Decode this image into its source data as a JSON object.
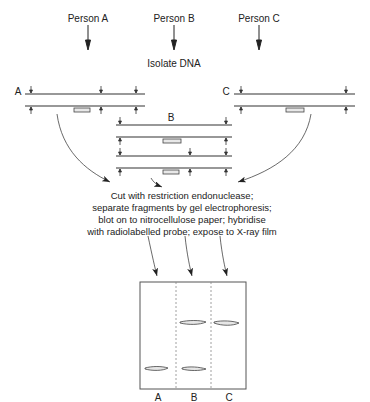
{
  "persons": [
    {
      "label": "Person A",
      "x": 88
    },
    {
      "label": "Person B",
      "x": 174
    },
    {
      "label": "Person C",
      "x": 259
    }
  ],
  "step1": "Isolate DNA",
  "dna_labels": {
    "a": "A",
    "b": "B",
    "c": "C"
  },
  "step2_lines": [
    "Cut with restriction endonuclease;",
    "separate fragments by gel electrophoresis;",
    "blot on to nitrocellulose paper; hybridise",
    "with radiolabelled probe; expose to X-ray film"
  ],
  "gel": {
    "lanes": [
      "A",
      "B",
      "C"
    ],
    "bands": [
      {
        "lane": "A",
        "position": "low"
      },
      {
        "lane": "B",
        "position": "high"
      },
      {
        "lane": "B",
        "position": "low"
      },
      {
        "lane": "C",
        "position": "high"
      }
    ]
  }
}
